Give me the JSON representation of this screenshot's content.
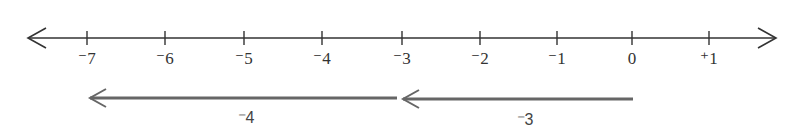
{
  "number_line": {
    "y": 38,
    "x_start": 28,
    "x_end": 776,
    "color": "#333333",
    "ticks": [
      {
        "value": -7,
        "label": "⁻7",
        "x": 87
      },
      {
        "value": -6,
        "label": "⁻6",
        "x": 165
      },
      {
        "value": -5,
        "label": "⁻5",
        "x": 244
      },
      {
        "value": -4,
        "label": "⁻4",
        "x": 322
      },
      {
        "value": -3,
        "label": "⁻3",
        "x": 402
      },
      {
        "value": -2,
        "label": "⁻2",
        "x": 480
      },
      {
        "value": -1,
        "label": "⁻1",
        "x": 557
      },
      {
        "value": 0,
        "label": "0",
        "x": 632
      },
      {
        "value": 1,
        "label": "⁺1",
        "x": 709
      }
    ]
  },
  "jumps": [
    {
      "from": 0,
      "to": -3,
      "x_from": 633,
      "x_to": 403,
      "y": 99,
      "label": "⁻3",
      "label_x": 525,
      "label_y": 112
    },
    {
      "from": -3,
      "to": -7,
      "x_from": 397,
      "x_to": 90,
      "y": 98,
      "label": "⁻4",
      "label_x": 246,
      "label_y": 110
    }
  ],
  "jump_color": "#666666"
}
